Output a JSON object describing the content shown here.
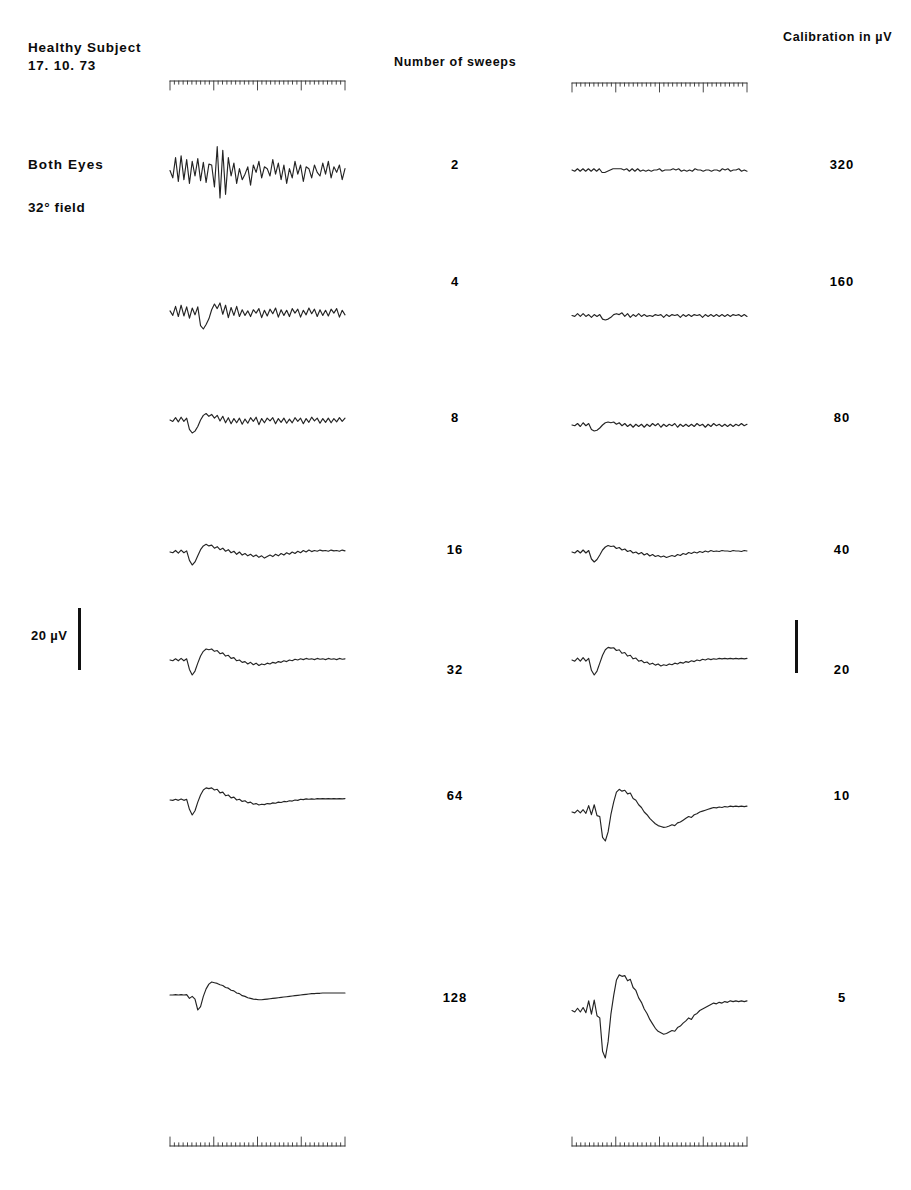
{
  "figure": {
    "subject_title": "Healthy Subject",
    "subject_date": "17. 10. 73",
    "eyes_label": "Both Eyes",
    "field_label": "32° field",
    "sweeps_header": "Number of sweeps",
    "calibration_header": "Calibration in µV",
    "calibration_bar_label": "20 µV"
  },
  "chart_data": {
    "type": "line",
    "subtitle": "Visual evoked potential averaging: effect of number of sweeps",
    "xlabel": "",
    "ylabel": "",
    "grid": false,
    "legend": "none",
    "columns": [
      {
        "name": "left-traces",
        "description": "Averaged VEP traces at fixed display gain"
      },
      {
        "name": "right-traces",
        "description": "Same averaged VEP traces at calibration gain shown at right"
      }
    ],
    "rows": [
      {
        "sweeps": "2",
        "calibration_uv": "320"
      },
      {
        "sweeps": "4",
        "calibration_uv": "160"
      },
      {
        "sweeps": "8",
        "calibration_uv": "80"
      },
      {
        "sweeps": "16",
        "calibration_uv": "40"
      },
      {
        "sweeps": "32",
        "calibration_uv": "20"
      },
      {
        "sweeps": "64",
        "calibration_uv": "10"
      },
      {
        "sweeps": "128",
        "calibration_uv": "5"
      }
    ],
    "sweep_counts": [
      2,
      4,
      8,
      16,
      32,
      64,
      128
    ],
    "calibration_values_uv": [
      320,
      160,
      80,
      40,
      20,
      10,
      5
    ],
    "amplitude_scale_bar_uv": 20,
    "series": [
      {
        "name": "left-2-sweeps",
        "column": "left",
        "sweeps": 2,
        "values": [
          0,
          -8,
          14,
          -12,
          16,
          -10,
          12,
          -14,
          10,
          -6,
          13,
          -11,
          9,
          -13,
          7,
          6,
          -18,
          26,
          -30,
          22,
          -26,
          14,
          -6,
          8,
          -14,
          2,
          -10,
          -4,
          4,
          -16,
          6,
          -2,
          10,
          -8,
          4,
          2,
          -6,
          12,
          -4,
          8,
          -10,
          6,
          -14,
          2,
          -8,
          10,
          -4,
          6,
          -12,
          4,
          2,
          -8,
          6,
          -2,
          -6,
          8,
          -4,
          10,
          -8,
          4,
          -2,
          6,
          -10,
          2
        ]
      },
      {
        "name": "left-4-sweeps",
        "column": "left",
        "sweeps": 4,
        "values": [
          2,
          -6,
          10,
          -8,
          12,
          -7,
          9,
          -11,
          7,
          -5,
          9,
          -24,
          -30,
          -22,
          -12,
          4,
          14,
          6,
          16,
          -4,
          12,
          -10,
          8,
          -6,
          10,
          -8,
          4,
          -6,
          2,
          -8,
          4,
          -2,
          6,
          -10,
          3,
          -7,
          5,
          -3,
          7,
          -9,
          4,
          -6,
          3,
          -8,
          6,
          -2,
          5,
          -9,
          3,
          -5,
          7,
          -3,
          5,
          -8,
          4,
          -6,
          3,
          -7,
          5,
          -2,
          6,
          -9,
          3,
          -5
        ]
      },
      {
        "name": "left-8-sweeps",
        "column": "left",
        "sweeps": 8,
        "values": [
          0,
          -3,
          5,
          -4,
          6,
          -3,
          4,
          -20,
          -28,
          -24,
          -14,
          0,
          10,
          14,
          8,
          12,
          4,
          10,
          -2,
          8,
          -6,
          5,
          -8,
          3,
          -6,
          4,
          -9,
          2,
          -7,
          5,
          -3,
          6,
          -10,
          3,
          -6,
          4,
          -2,
          5,
          -8,
          3,
          -5,
          4,
          -7,
          2,
          -6,
          5,
          -3,
          4,
          -8,
          3,
          -5,
          6,
          -2,
          4,
          -7,
          3,
          -5,
          4,
          -6,
          3,
          -4,
          5,
          -3,
          4
        ]
      },
      {
        "name": "left-16-sweeps",
        "column": "left",
        "sweeps": 16,
        "values": [
          0,
          -2,
          4,
          -3,
          5,
          -2,
          3,
          -22,
          -34,
          -26,
          -10,
          6,
          16,
          20,
          16,
          18,
          10,
          14,
          6,
          10,
          2,
          6,
          -2,
          2,
          -6,
          0,
          -8,
          -4,
          -10,
          -6,
          -12,
          -8,
          -14,
          -10,
          -16,
          -12,
          -8,
          -12,
          -6,
          -10,
          -4,
          -8,
          -2,
          -6,
          0,
          -4,
          2,
          -2,
          4,
          0,
          5,
          1,
          4,
          2,
          5,
          3,
          4,
          2,
          5,
          3,
          4,
          2,
          5,
          3
        ]
      },
      {
        "name": "left-32-sweeps",
        "column": "left",
        "sweeps": 32,
        "values": [
          0,
          -2,
          3,
          -2,
          4,
          -2,
          3,
          -24,
          -38,
          -28,
          -8,
          10,
          22,
          28,
          26,
          28,
          22,
          24,
          16,
          18,
          10,
          12,
          4,
          6,
          -2,
          0,
          -6,
          -4,
          -10,
          -6,
          -12,
          -8,
          -14,
          -10,
          -12,
          -8,
          -10,
          -6,
          -8,
          -4,
          -6,
          -2,
          -4,
          0,
          -2,
          2,
          0,
          3,
          1,
          4,
          2,
          3,
          1,
          4,
          2,
          3,
          1,
          4,
          2,
          3,
          1,
          4,
          2,
          3
        ]
      },
      {
        "name": "left-64-sweeps",
        "column": "left",
        "sweeps": 64,
        "values": [
          0,
          -1,
          2,
          -1,
          3,
          -1,
          2,
          -26,
          -42,
          -30,
          -6,
          14,
          28,
          34,
          32,
          34,
          28,
          30,
          20,
          22,
          12,
          14,
          6,
          8,
          0,
          2,
          -4,
          -2,
          -8,
          -6,
          -12,
          -10,
          -14,
          -12,
          -13,
          -10,
          -11,
          -8,
          -9,
          -6,
          -7,
          -4,
          -5,
          -2,
          -3,
          0,
          -1,
          2,
          1,
          3,
          2,
          3,
          2,
          4,
          3,
          4,
          3,
          4,
          3,
          4,
          3,
          4,
          3,
          4
        ]
      },
      {
        "name": "left-128-sweeps",
        "column": "left",
        "sweeps": 128,
        "values": [
          0,
          0,
          1,
          0,
          1,
          0,
          1,
          -10,
          -4,
          -12,
          -44,
          -34,
          -4,
          18,
          32,
          38,
          36,
          34,
          30,
          28,
          22,
          20,
          14,
          12,
          6,
          4,
          -2,
          -4,
          -8,
          -10,
          -12,
          -13,
          -14,
          -14,
          -13,
          -12,
          -11,
          -10,
          -9,
          -8,
          -7,
          -6,
          -5,
          -4,
          -3,
          -2,
          -1,
          0,
          1,
          2,
          3,
          4,
          4,
          5,
          5,
          6,
          6,
          6,
          6,
          6,
          6,
          6,
          6,
          6
        ]
      },
      {
        "name": "right-2-sweeps",
        "column": "right",
        "sweeps": 2,
        "calibration_uv": 320,
        "values": [
          0,
          -1,
          1,
          -1,
          1,
          -1,
          1,
          -1,
          1,
          -1,
          1,
          -2,
          -2,
          -1,
          0,
          1,
          1,
          1,
          1,
          0,
          1,
          -1,
          1,
          -1,
          1,
          -1,
          0,
          -1,
          0,
          -1,
          0,
          0,
          1,
          -1,
          0,
          0,
          0,
          1,
          0,
          1,
          -1,
          0,
          -1,
          0,
          -1,
          1,
          0,
          0,
          -1,
          0,
          0,
          -1,
          0,
          0,
          -1,
          1,
          0,
          1,
          -1,
          0,
          0,
          1,
          -1,
          0,
          -1
        ]
      },
      {
        "name": "right-4-sweeps",
        "column": "right",
        "sweeps": 4,
        "calibration_uv": 160,
        "values": [
          0,
          -1,
          2,
          -1,
          2,
          -1,
          1,
          -2,
          1,
          -1,
          1,
          -4,
          -5,
          -4,
          -2,
          1,
          2,
          1,
          3,
          -1,
          2,
          -2,
          1,
          -1,
          2,
          -1,
          1,
          -1,
          0,
          -1,
          1,
          0,
          1,
          -2,
          1,
          -1,
          1,
          0,
          1,
          -2,
          1,
          -1,
          1,
          -1,
          1,
          0,
          1,
          -2,
          1,
          -1,
          1,
          -1,
          1,
          -1,
          1,
          -1,
          1,
          -1,
          1,
          0,
          1,
          -1,
          1,
          -1
        ]
      },
      {
        "name": "right-8-sweeps",
        "column": "right",
        "sweeps": 8,
        "calibration_uv": 80,
        "values": [
          0,
          -1,
          2,
          -2,
          3,
          -1,
          2,
          -6,
          -8,
          -7,
          -4,
          0,
          3,
          4,
          3,
          4,
          1,
          3,
          -1,
          2,
          -2,
          1,
          -3,
          1,
          -2,
          1,
          -3,
          1,
          -2,
          2,
          -1,
          2,
          -3,
          1,
          -2,
          1,
          -1,
          2,
          -3,
          1,
          -2,
          1,
          -2,
          1,
          -2,
          2,
          -1,
          1,
          -3,
          1,
          -2,
          2,
          -1,
          1,
          -2,
          1,
          -2,
          1,
          -2,
          1,
          -1,
          2,
          -1,
          1
        ]
      },
      {
        "name": "right-16-sweeps",
        "column": "right",
        "sweeps": 16,
        "calibration_uv": 40,
        "values": [
          0,
          -2,
          3,
          -2,
          4,
          -2,
          3,
          -14,
          -20,
          -15,
          -6,
          4,
          10,
          13,
          11,
          12,
          7,
          9,
          4,
          6,
          1,
          3,
          -2,
          0,
          -4,
          -1,
          -6,
          -3,
          -8,
          -5,
          -9,
          -7,
          -10,
          -8,
          -11,
          -9,
          -7,
          -9,
          -5,
          -7,
          -3,
          -5,
          -1,
          -3,
          0,
          -2,
          1,
          -1,
          2,
          0,
          3,
          1,
          2,
          1,
          3,
          2,
          2,
          1,
          3,
          2,
          2,
          1,
          3,
          2
        ]
      },
      {
        "name": "right-32-sweeps",
        "column": "right",
        "sweeps": 32,
        "calibration_uv": 20,
        "values": [
          0,
          -3,
          5,
          -3,
          6,
          -3,
          4,
          -26,
          -38,
          -28,
          -8,
          12,
          26,
          32,
          30,
          31,
          24,
          26,
          17,
          19,
          10,
          12,
          3,
          5,
          -3,
          -1,
          -7,
          -5,
          -11,
          -8,
          -13,
          -10,
          -15,
          -12,
          -14,
          -10,
          -12,
          -8,
          -10,
          -6,
          -8,
          -4,
          -6,
          -2,
          -4,
          0,
          -2,
          2,
          0,
          3,
          1,
          3,
          2,
          4,
          3,
          4,
          3,
          4,
          3,
          4,
          3,
          4,
          3,
          4
        ]
      },
      {
        "name": "right-64-sweeps",
        "column": "right",
        "sweeps": 64,
        "calibration_uv": 10,
        "values": [
          0,
          -2,
          4,
          -2,
          5,
          -3,
          14,
          -6,
          16,
          -8,
          -10,
          -56,
          -64,
          -44,
          -6,
          22,
          44,
          50,
          46,
          48,
          40,
          42,
          30,
          26,
          16,
          10,
          0,
          -6,
          -14,
          -20,
          -26,
          -30,
          -32,
          -34,
          -33,
          -31,
          -28,
          -30,
          -24,
          -22,
          -18,
          -14,
          -10,
          -12,
          -6,
          -4,
          0,
          2,
          4,
          6,
          8,
          10,
          9,
          11,
          10,
          12,
          11,
          13,
          12,
          13,
          12,
          13,
          12,
          13
        ]
      },
      {
        "name": "right-128-sweeps",
        "column": "right",
        "sweeps": 128,
        "calibration_uv": 5,
        "values": [
          0,
          -4,
          6,
          -4,
          8,
          -6,
          26,
          -10,
          28,
          -14,
          -20,
          -110,
          -128,
          -84,
          -10,
          40,
          82,
          96,
          92,
          94,
          80,
          84,
          62,
          54,
          34,
          22,
          4,
          -8,
          -24,
          -36,
          -48,
          -56,
          -60,
          -64,
          -62,
          -58,
          -54,
          -56,
          -46,
          -42,
          -34,
          -28,
          -20,
          -24,
          -12,
          -8,
          0,
          4,
          8,
          12,
          16,
          20,
          18,
          22,
          20,
          24,
          22,
          26,
          24,
          26,
          24,
          26,
          24,
          26
        ]
      }
    ],
    "time_rulers": [
      {
        "name": "top-left-ruler",
        "position": "top",
        "column": "left",
        "major_ticks": 4,
        "minor_ticks_per_major": 10
      },
      {
        "name": "top-right-ruler",
        "position": "top",
        "column": "right",
        "major_ticks": 4,
        "minor_ticks_per_major": 10
      },
      {
        "name": "bottom-left-ruler",
        "position": "bottom",
        "column": "left",
        "major_ticks": 4,
        "minor_ticks_per_major": 10
      },
      {
        "name": "bottom-right-ruler",
        "position": "bottom",
        "column": "right",
        "major_ticks": 4,
        "minor_ticks_per_major": 10
      }
    ]
  }
}
